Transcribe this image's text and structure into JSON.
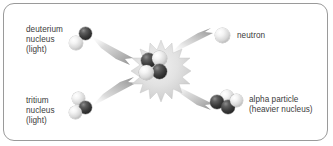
{
  "diagram": {
    "frame": {
      "border_color": "#9a9a9a",
      "background": "#ffffff"
    },
    "text_color": "#3b3b3b",
    "sphere_colors": {
      "proton_dark": "#2e2e2e",
      "neutron_light": "#e4e4e4"
    },
    "labels": {
      "deuterium_line1": "deuterium",
      "deuterium_line2": "nucleus",
      "deuterium_line3": "(light)",
      "tritium_line1": "tritium",
      "tritium_line2": "nucleus",
      "tritium_line3": "(light)",
      "neutron": "neutron",
      "alpha_line1": "alpha particle",
      "alpha_line2": "(heavier nucleus)"
    },
    "particles": [
      {
        "name": "deuterium-nucleus",
        "spheres": 2,
        "composition": [
          "dark",
          "light"
        ]
      },
      {
        "name": "tritium-nucleus",
        "spheres": 3,
        "composition": [
          "light",
          "dark",
          "light"
        ]
      },
      {
        "name": "fusion-core",
        "spheres": 4,
        "composition": [
          "dark",
          "light",
          "dark",
          "light"
        ]
      },
      {
        "name": "neutron-product",
        "spheres": 1,
        "composition": [
          "light"
        ]
      },
      {
        "name": "alpha-particle",
        "spheres": 4,
        "composition": [
          "dark",
          "light",
          "dark",
          "light"
        ]
      }
    ],
    "arrows": [
      {
        "name": "deuterium-to-core",
        "direction": "down-right"
      },
      {
        "name": "tritium-to-core",
        "direction": "up-right"
      },
      {
        "name": "core-to-neutron",
        "direction": "up-right"
      },
      {
        "name": "core-to-alpha",
        "direction": "down-right"
      }
    ]
  }
}
